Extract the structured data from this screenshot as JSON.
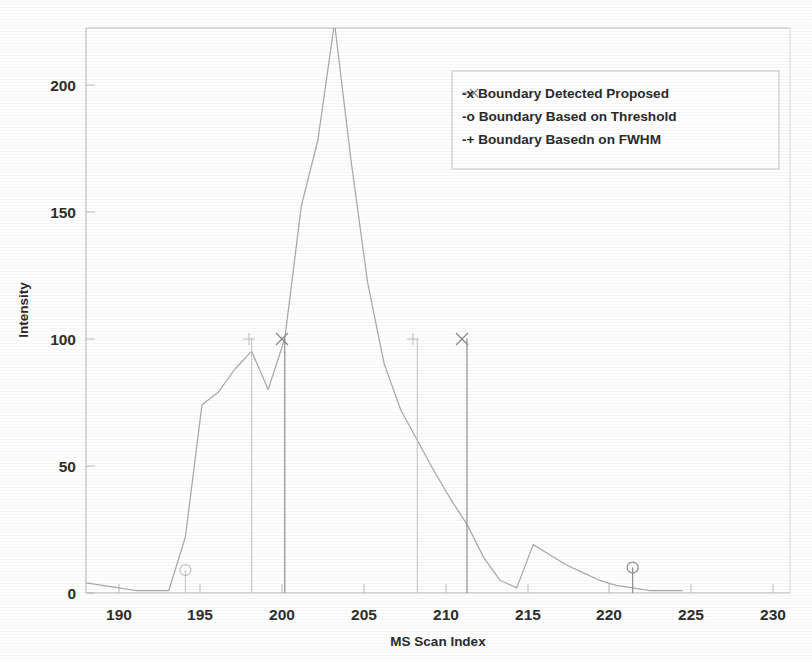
{
  "figure": {
    "kind": "scanned-scientific-figure",
    "background_color": "#ffffff",
    "curve_color": "#a9a9a9",
    "marker_color": "#8a8a8a"
  },
  "chart_data": {
    "type": "line",
    "title": "",
    "xlabel": "MS Scan Index",
    "ylabel": "Intensity",
    "xlim": [
      188,
      230.5
    ],
    "ylim": [
      0,
      222
    ],
    "grid": false,
    "xticks": [
      190,
      195,
      200,
      205,
      210,
      215,
      220,
      225,
      230
    ],
    "xtick_labels": [
      "190",
      "195",
      "200",
      "205",
      "210",
      "215",
      "220",
      "225",
      "230"
    ],
    "yticks": [
      0,
      50,
      100,
      150,
      200
    ],
    "ytick_labels": [
      "0",
      "50",
      "100",
      "150",
      "200"
    ],
    "legend_position": "upper right",
    "legend_entries": [
      {
        "marker": "-x",
        "label": "Boundary Detected Proposed"
      },
      {
        "marker": "-o",
        "label": "Boundary Based on Threshold"
      },
      {
        "marker": "-+",
        "label": "Boundary Basedn on FWHM"
      }
    ],
    "series": [
      {
        "name": "MS chromatogram intensity",
        "type": "line",
        "x": [
          188,
          189,
          190,
          191,
          192,
          193,
          194,
          195,
          196,
          197,
          198,
          199,
          200,
          201,
          202,
          203,
          204,
          205,
          206,
          207,
          208,
          209,
          210,
          211,
          212,
          213,
          214,
          215,
          216,
          217,
          218,
          219,
          220,
          221,
          222,
          223,
          224
        ],
        "y": [
          4,
          3,
          2,
          1,
          1,
          1,
          22,
          74,
          79,
          88,
          95,
          80,
          100,
          152,
          178,
          224,
          170,
          122,
          90,
          72,
          60,
          48,
          37,
          27,
          14,
          5,
          2,
          19,
          15,
          11,
          8,
          5,
          3,
          2,
          1,
          1,
          1
        ]
      }
    ],
    "boundary_markers": [
      {
        "type": "proposed",
        "marker": "x",
        "x": 200,
        "y": 100,
        "stem": true,
        "emphasis": "dark"
      },
      {
        "type": "proposed",
        "marker": "x",
        "x": 211,
        "y": 100,
        "stem": true,
        "emphasis": "dark"
      },
      {
        "type": "fwhm",
        "marker": "+",
        "x": 198,
        "y": 100,
        "stem": true,
        "emphasis": "faint"
      },
      {
        "type": "fwhm",
        "marker": "+",
        "x": 208,
        "y": 100,
        "stem": true,
        "emphasis": "faint"
      },
      {
        "type": "threshold",
        "marker": "o",
        "x": 194,
        "y": 9,
        "stem": true,
        "emphasis": "faint"
      },
      {
        "type": "threshold",
        "marker": "o",
        "x": 221,
        "y": 10,
        "stem": true,
        "emphasis": "faint"
      }
    ],
    "annotations": [
      "Main chromatographic peak apex at scan 203 is clipped by the top of the axes",
      "Secondary small bump near scan 215"
    ]
  }
}
